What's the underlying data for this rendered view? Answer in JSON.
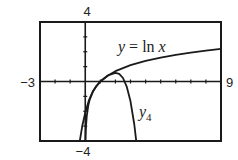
{
  "chart_data": {
    "type": "line",
    "title": "",
    "xlabel": "",
    "ylabel": "",
    "xlim": [
      -3,
      9
    ],
    "ylim": [
      -4,
      4
    ],
    "x_tick_step": 1,
    "y_tick_step": 1,
    "grid": false,
    "legend": "inline labels",
    "tick_labels": {
      "xmin": "−3",
      "xmax": "9",
      "ymin": "−4",
      "ymax": "4"
    },
    "series": [
      {
        "name": "y = ln x",
        "label_parts": [
          "y",
          " = ln ",
          "x"
        ],
        "points": [
          [
            0.0183,
            -4
          ],
          [
            0.05,
            -2.996
          ],
          [
            0.1,
            -2.303
          ],
          [
            0.2,
            -1.609
          ],
          [
            0.3,
            -1.204
          ],
          [
            0.5,
            -0.693
          ],
          [
            0.75,
            -0.288
          ],
          [
            1,
            0
          ],
          [
            1.5,
            0.405
          ],
          [
            2,
            0.693
          ],
          [
            3,
            1.099
          ],
          [
            4,
            1.386
          ],
          [
            5,
            1.609
          ],
          [
            6,
            1.792
          ],
          [
            7,
            1.946
          ],
          [
            8,
            2.079
          ],
          [
            9,
            2.197
          ]
        ]
      },
      {
        "name": "y4",
        "label_parts": [
          "y",
          "4"
        ],
        "points": [
          [
            -0.36,
            -4.0
          ],
          [
            -0.2,
            -3.014
          ],
          [
            0,
            -2.083
          ],
          [
            0.25,
            -1.251
          ],
          [
            0.5,
            -0.682
          ],
          [
            0.75,
            -0.287
          ],
          [
            1,
            0
          ],
          [
            1.5,
            0.401
          ],
          [
            2,
            0.583
          ],
          [
            2.25,
            0.51
          ],
          [
            2.5,
            0.234
          ],
          [
            2.75,
            -0.34
          ],
          [
            3,
            -1.333
          ],
          [
            3.25,
            -2.891
          ],
          [
            3.38,
            -3.98
          ]
        ]
      }
    ],
    "annotations": [
      {
        "text": "y = ln x",
        "x": 4.8,
        "y": 2.0
      },
      {
        "text": "y4",
        "x": 3.6,
        "y": -2.4
      }
    ]
  },
  "labels": {
    "ymax": "4",
    "ymin": "−4",
    "xmin": "−3",
    "xmax": "9",
    "ln_y": "y",
    "ln_mid": " = ln ",
    "ln_x": "x",
    "y4_y": "y",
    "y4_sub": "4"
  }
}
